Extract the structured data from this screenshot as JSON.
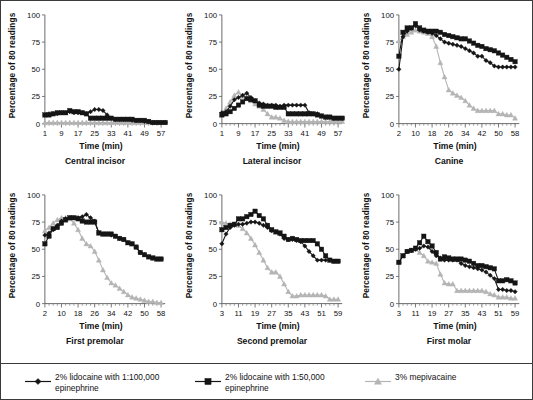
{
  "figure": {
    "axis_label_y": "Percentage of 80 readings",
    "axis_label_x": "Time (min)",
    "colors": {
      "lidocaine_100k": "#151515",
      "lidocaine_50k": "#151515",
      "mepivacaine": "#b4b4b4",
      "axis": "#555555",
      "border": "#3a3a3a"
    }
  },
  "legend": {
    "position": "bottom",
    "items": [
      {
        "marker": "diamond-marker-icon",
        "color": "#151515",
        "label": "2% lidocaine with 1:100,000\nepinephrine"
      },
      {
        "marker": "square-marker-icon",
        "color": "#151515",
        "label": "2% lidocaine with 1:50,000\nepinephrine"
      },
      {
        "marker": "triangle-marker-icon",
        "color": "#b4b4b4",
        "label": "3% mepivacaine"
      }
    ]
  },
  "chart_data": [
    {
      "type": "line",
      "title": "Central incisor",
      "xlabel": "Time (min)",
      "ylabel": "Percentage of 80 readings",
      "ylim": [
        0,
        100
      ],
      "yticks": [
        0,
        25,
        50,
        75,
        100
      ],
      "xlim": [
        1,
        59
      ],
      "xticks": [
        1,
        9,
        17,
        25,
        33,
        41,
        49,
        57
      ],
      "grid": false,
      "x": [
        1,
        3,
        5,
        7,
        9,
        11,
        13,
        15,
        17,
        19,
        21,
        23,
        25,
        27,
        29,
        31,
        33,
        35,
        37,
        39,
        41,
        43,
        45,
        47,
        49,
        51,
        53,
        55,
        57,
        59
      ],
      "series": [
        {
          "name": "2% lidocaine with 1:100,000 epinephrine",
          "values": [
            8,
            9,
            9,
            9,
            10,
            10,
            11,
            10,
            10,
            10,
            9,
            11,
            13,
            13,
            12,
            8,
            5,
            4,
            4,
            4,
            4,
            3,
            3,
            3,
            2,
            2,
            1,
            1,
            1,
            1
          ]
        },
        {
          "name": "2% lidocaine with 1:50,000 epinephrine",
          "values": [
            8,
            8,
            9,
            10,
            10,
            10,
            12,
            11,
            11,
            10,
            9,
            5,
            5,
            5,
            5,
            5,
            5,
            4,
            4,
            4,
            4,
            4,
            3,
            3,
            3,
            2,
            1,
            1,
            1,
            1
          ]
        },
        {
          "name": "3% mepivacaine",
          "values": [
            1,
            1,
            1,
            1,
            1,
            1,
            1,
            1,
            1,
            1,
            1,
            1,
            1,
            1,
            1,
            1,
            1,
            1,
            1,
            1,
            1,
            1,
            1,
            1,
            1,
            1,
            1,
            1,
            1,
            1
          ]
        }
      ]
    },
    {
      "type": "line",
      "title": "Lateral incisor",
      "xlabel": "Time (min)",
      "ylabel": "Percentage of 80 readings",
      "ylim": [
        0,
        100
      ],
      "yticks": [
        0,
        25,
        50,
        75,
        100
      ],
      "xlim": [
        1,
        59
      ],
      "xticks": [
        1,
        9,
        17,
        25,
        33,
        41,
        49,
        57
      ],
      "grid": false,
      "x": [
        1,
        3,
        5,
        7,
        9,
        11,
        13,
        15,
        17,
        19,
        21,
        23,
        25,
        27,
        29,
        31,
        33,
        35,
        37,
        39,
        41,
        43,
        45,
        47,
        49,
        51,
        53,
        55,
        57,
        59
      ],
      "series": [
        {
          "name": "2% lidocaine with 1:100,000 epinephrine",
          "values": [
            10,
            11,
            16,
            22,
            24,
            26,
            28,
            24,
            21,
            19,
            18,
            17,
            17,
            17,
            16,
            17,
            17,
            17,
            17,
            17,
            17,
            10,
            9,
            9,
            7,
            6,
            6,
            5,
            5,
            5
          ]
        },
        {
          "name": "2% lidocaine with 1:50,000 epinephrine",
          "values": [
            8,
            9,
            11,
            14,
            17,
            20,
            23,
            22,
            21,
            17,
            16,
            16,
            16,
            15,
            15,
            15,
            9,
            9,
            9,
            9,
            9,
            9,
            9,
            8,
            7,
            6,
            6,
            5,
            5,
            5
          ]
        },
        {
          "name": "3% mepivacaine",
          "values": [
            9,
            14,
            20,
            26,
            29,
            25,
            24,
            21,
            18,
            16,
            13,
            9,
            6,
            6,
            5,
            3,
            2,
            2,
            2,
            2,
            2,
            2,
            2,
            2,
            2,
            2,
            2,
            2,
            2,
            2
          ]
        }
      ]
    },
    {
      "type": "line",
      "title": "Canine",
      "xlabel": "Time (min)",
      "ylabel": "Percentage of 80 readings",
      "ylim": [
        0,
        100
      ],
      "yticks": [
        0,
        25,
        50,
        75,
        100
      ],
      "xlim": [
        2,
        60
      ],
      "xticks": [
        2,
        10,
        18,
        26,
        34,
        42,
        50,
        58
      ],
      "grid": false,
      "x": [
        2,
        4,
        6,
        8,
        10,
        12,
        14,
        16,
        18,
        20,
        22,
        24,
        26,
        28,
        30,
        32,
        34,
        36,
        38,
        40,
        42,
        44,
        46,
        48,
        50,
        52,
        54,
        56,
        58
      ],
      "series": [
        {
          "name": "2% lidocaine with 1:100,000 epinephrine",
          "values": [
            50,
            80,
            85,
            88,
            90,
            86,
            85,
            84,
            83,
            81,
            78,
            75,
            74,
            73,
            72,
            71,
            69,
            67,
            65,
            62,
            62,
            58,
            56,
            53,
            52,
            52,
            52,
            52,
            52
          ]
        },
        {
          "name": "2% lidocaine with 1:50,000 epinephrine",
          "values": [
            62,
            84,
            88,
            88,
            92,
            88,
            86,
            85,
            85,
            85,
            84,
            82,
            81,
            80,
            79,
            78,
            78,
            76,
            74,
            72,
            71,
            69,
            68,
            67,
            65,
            63,
            61,
            59,
            57
          ]
        },
        {
          "name": "3% mepivacaine",
          "values": [
            76,
            80,
            82,
            84,
            86,
            85,
            84,
            83,
            80,
            71,
            56,
            43,
            31,
            28,
            26,
            24,
            21,
            17,
            14,
            12,
            12,
            12,
            12,
            12,
            9,
            9,
            8,
            8,
            5
          ]
        }
      ]
    },
    {
      "type": "line",
      "title": "First premolar",
      "xlabel": "Time (min)",
      "ylabel": "Percentage of 80 readings",
      "ylim": [
        0,
        100
      ],
      "yticks": [
        0,
        25,
        50,
        75,
        100
      ],
      "xlim": [
        2,
        60
      ],
      "xticks": [
        2,
        10,
        18,
        26,
        34,
        42,
        50,
        58
      ],
      "grid": false,
      "x": [
        2,
        4,
        6,
        8,
        10,
        12,
        14,
        16,
        18,
        20,
        22,
        24,
        26,
        28,
        30,
        32,
        34,
        36,
        38,
        40,
        42,
        44,
        46,
        48,
        50,
        52,
        54,
        56,
        58
      ],
      "series": [
        {
          "name": "2% lidocaine with 1:100,000 epinephrine",
          "values": [
            63,
            65,
            68,
            72,
            76,
            78,
            79,
            79,
            79,
            80,
            82,
            79,
            76,
            65,
            64,
            64,
            63,
            62,
            60,
            59,
            56,
            55,
            52,
            47,
            45,
            43,
            42,
            41,
            41
          ]
        },
        {
          "name": "2% lidocaine with 1:50,000 epinephrine",
          "values": [
            55,
            62,
            69,
            70,
            74,
            77,
            79,
            79,
            78,
            76,
            75,
            75,
            75,
            65,
            64,
            64,
            64,
            62,
            60,
            59,
            56,
            55,
            52,
            47,
            45,
            43,
            42,
            41,
            41
          ]
        },
        {
          "name": "3% mepivacaine",
          "values": [
            67,
            70,
            74,
            77,
            79,
            79,
            78,
            74,
            68,
            60,
            55,
            53,
            48,
            40,
            31,
            24,
            19,
            17,
            14,
            11,
            8,
            6,
            5,
            4,
            3,
            2,
            2,
            1,
            1
          ]
        }
      ]
    },
    {
      "type": "line",
      "title": "Second premolar",
      "xlabel": "Time (min)",
      "ylabel": "Percentage of 80 readings",
      "ylim": [
        0,
        100
      ],
      "yticks": [
        0,
        25,
        50,
        75,
        100
      ],
      "xlim": [
        3,
        61
      ],
      "xticks": [
        3,
        11,
        19,
        27,
        35,
        43,
        51,
        59
      ],
      "grid": false,
      "x": [
        3,
        5,
        7,
        9,
        11,
        13,
        15,
        17,
        19,
        21,
        23,
        25,
        27,
        29,
        31,
        33,
        35,
        37,
        39,
        41,
        43,
        45,
        47,
        49,
        51,
        53,
        55,
        57,
        59
      ],
      "series": [
        {
          "name": "2% lidocaine with 1:100,000 epinephrine",
          "values": [
            55,
            64,
            70,
            72,
            73,
            73,
            74,
            75,
            75,
            74,
            72,
            70,
            67,
            66,
            64,
            60,
            59,
            59,
            58,
            57,
            53,
            48,
            44,
            40,
            40,
            40,
            40,
            39,
            39
          ]
        },
        {
          "name": "2% lidocaine with 1:50,000 epinephrine",
          "values": [
            68,
            70,
            72,
            73,
            78,
            78,
            80,
            82,
            85,
            81,
            78,
            72,
            68,
            66,
            65,
            62,
            59,
            60,
            59,
            58,
            58,
            58,
            58,
            55,
            50,
            44,
            40,
            39,
            39
          ]
        },
        {
          "name": "3% mepivacaine",
          "values": [
            75,
            74,
            73,
            73,
            72,
            69,
            65,
            60,
            54,
            47,
            40,
            33,
            29,
            29,
            25,
            18,
            11,
            7,
            7,
            8,
            8,
            8,
            8,
            8,
            8,
            7,
            4,
            4,
            4
          ]
        }
      ]
    },
    {
      "type": "line",
      "title": "First molar",
      "xlabel": "Time (min)",
      "ylabel": "Percentage of 80 readings",
      "ylim": [
        0,
        100
      ],
      "yticks": [
        0,
        25,
        50,
        75,
        100
      ],
      "xlim": [
        3,
        61
      ],
      "xticks": [
        3,
        11,
        19,
        27,
        35,
        43,
        51,
        59
      ],
      "grid": false,
      "x": [
        3,
        5,
        7,
        9,
        11,
        13,
        15,
        17,
        19,
        21,
        23,
        25,
        27,
        29,
        31,
        33,
        35,
        37,
        39,
        41,
        43,
        45,
        47,
        49,
        51,
        53,
        55,
        57,
        59
      ],
      "series": [
        {
          "name": "2% lidocaine with 1:100,000 epinephrine",
          "values": [
            38,
            44,
            48,
            49,
            50,
            51,
            53,
            52,
            48,
            44,
            42,
            40,
            40,
            40,
            40,
            37,
            35,
            34,
            33,
            32,
            31,
            29,
            26,
            23,
            13,
            13,
            12,
            12,
            11
          ]
        },
        {
          "name": "2% lidocaine with 1:50,000 epinephrine",
          "values": [
            38,
            44,
            48,
            49,
            51,
            56,
            62,
            57,
            53,
            47,
            41,
            43,
            42,
            41,
            41,
            41,
            40,
            39,
            37,
            35,
            35,
            34,
            33,
            32,
            21,
            21,
            22,
            21,
            19
          ]
        },
        {
          "name": "3% mepivacaine",
          "values": [
            38,
            44,
            48,
            49,
            50,
            47,
            44,
            39,
            38,
            37,
            27,
            19,
            18,
            18,
            12,
            12,
            12,
            12,
            12,
            12,
            12,
            11,
            9,
            8,
            6,
            6,
            6,
            5,
            5
          ]
        }
      ]
    }
  ]
}
